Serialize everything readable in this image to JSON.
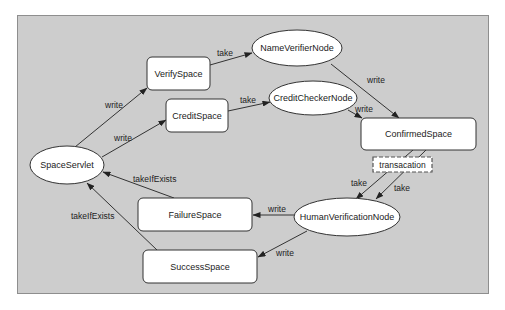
{
  "diagram": {
    "background": "#cdcdcd",
    "frame_border": "#8e8e8e",
    "node_fill": "#ffffff",
    "stroke": "#333333",
    "nodes": [
      {
        "id": "SpaceServlet",
        "label": "SpaceServlet",
        "shape": "ellipse",
        "cx": 67,
        "cy": 165,
        "rx": 37,
        "ry": 19
      },
      {
        "id": "VerifySpace",
        "label": "VerifySpace",
        "shape": "rect",
        "x": 147,
        "y": 57,
        "w": 63,
        "h": 33
      },
      {
        "id": "CreditSpace",
        "label": "CreditSpace",
        "shape": "rect",
        "x": 166,
        "y": 99,
        "w": 62,
        "h": 33
      },
      {
        "id": "NameVerifierNode",
        "label": "NameVerifierNode",
        "shape": "ellipse",
        "cx": 297,
        "cy": 48,
        "rx": 45,
        "ry": 18
      },
      {
        "id": "CreditCheckerNode",
        "label": "CreditCheckerNode",
        "shape": "ellipse",
        "cx": 313,
        "cy": 98,
        "rx": 44,
        "ry": 17
      },
      {
        "id": "ConfirmedSpace",
        "label": "ConfirmedSpace",
        "shape": "rect",
        "x": 361,
        "y": 118,
        "w": 115,
        "h": 32
      },
      {
        "id": "HumanVerificationNode",
        "label": "HumanVerificationNode",
        "shape": "ellipse",
        "cx": 347,
        "cy": 217,
        "rx": 53,
        "ry": 19
      },
      {
        "id": "FailureSpace",
        "label": "FailureSpace",
        "shape": "rect",
        "x": 138,
        "y": 198,
        "w": 114,
        "h": 33
      },
      {
        "id": "SuccessSpace",
        "label": "SuccessSpace",
        "shape": "rect",
        "x": 143,
        "y": 250,
        "w": 114,
        "h": 33
      }
    ],
    "edges": [
      {
        "from": "SpaceServlet",
        "to": "VerifySpace",
        "label": "write",
        "x1": 75,
        "y1": 147,
        "x2": 147,
        "y2": 88,
        "lx": 105,
        "ly": 108
      },
      {
        "from": "SpaceServlet",
        "to": "CreditSpace",
        "label": "write",
        "x1": 102,
        "y1": 157,
        "x2": 166,
        "y2": 120,
        "lx": 114,
        "ly": 141
      },
      {
        "from": "VerifySpace",
        "to": "NameVerifierNode",
        "label": "take",
        "x1": 210,
        "y1": 65,
        "x2": 252,
        "y2": 53,
        "lx": 217,
        "ly": 56
      },
      {
        "from": "CreditSpace",
        "to": "CreditCheckerNode",
        "label": "take",
        "x1": 228,
        "y1": 111,
        "x2": 270,
        "y2": 102,
        "lx": 240,
        "ly": 103
      },
      {
        "from": "NameVerifierNode",
        "to": "ConfirmedSpace",
        "label": "write",
        "x1": 331,
        "y1": 64,
        "x2": 399,
        "y2": 118,
        "lx": 367,
        "ly": 83
      },
      {
        "from": "CreditCheckerNode",
        "to": "ConfirmedSpace",
        "label": "write",
        "x1": 348,
        "y1": 110,
        "x2": 362,
        "y2": 118,
        "lx": 355,
        "ly": 112
      },
      {
        "from": "ConfirmedSpace",
        "to": "HumanVerificationNode",
        "label": "take",
        "x1": 413,
        "y1": 150,
        "x2": 356,
        "y2": 199,
        "lx": 351,
        "ly": 186
      },
      {
        "from": "ConfirmedSpace",
        "to": "HumanVerificationNode",
        "label": "take",
        "x1": 426,
        "y1": 150,
        "x2": 376,
        "y2": 199,
        "lx": 394,
        "ly": 191
      },
      {
        "from": "HumanVerificationNode",
        "to": "FailureSpace",
        "label": "write",
        "x1": 294,
        "y1": 215,
        "x2": 253,
        "y2": 215,
        "lx": 268,
        "ly": 212
      },
      {
        "from": "HumanVerificationNode",
        "to": "SuccessSpace",
        "label": "write",
        "x1": 307,
        "y1": 231,
        "x2": 258,
        "y2": 257,
        "lx": 276,
        "ly": 256
      },
      {
        "from": "FailureSpace",
        "to": "SpaceServlet",
        "label": "takeIfExists",
        "x1": 174,
        "y1": 198,
        "x2": 103,
        "y2": 172,
        "lx": 133,
        "ly": 182
      },
      {
        "from": "SuccessSpace",
        "to": "SpaceServlet",
        "label": "takeIfExists",
        "x1": 157,
        "y1": 250,
        "x2": 87,
        "y2": 183,
        "lx": 71,
        "ly": 219
      }
    ],
    "annotation": {
      "label": "transacation",
      "x": 373,
      "y": 157,
      "w": 59,
      "h": 15,
      "style": "dashed"
    }
  }
}
